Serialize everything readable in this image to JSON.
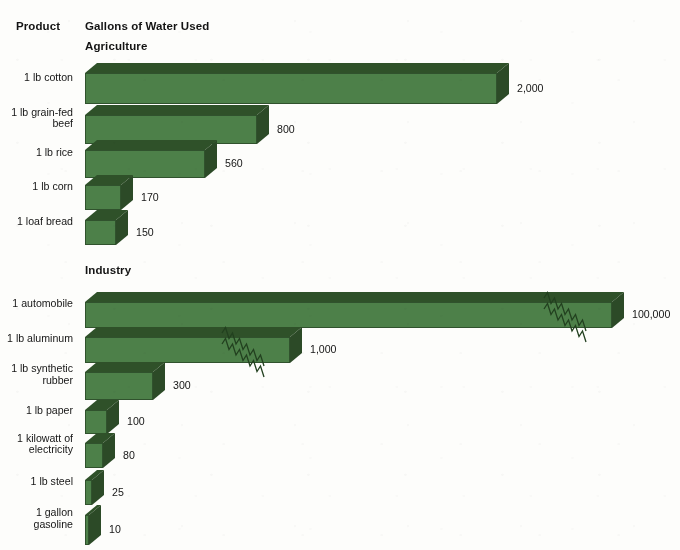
{
  "headers": {
    "product": "Product",
    "gallons": "Gallons of Water Used"
  },
  "sections": [
    {
      "key": "agriculture",
      "title": "Agriculture"
    },
    {
      "key": "industry",
      "title": "Industry"
    }
  ],
  "colors": {
    "bar_front": "#4d8049",
    "bar_top": "#2f5129",
    "bar_end": "#2c4a27",
    "background": "#fdfdfb",
    "text": "#141414"
  },
  "chart_data": {
    "type": "bar",
    "orientation": "horizontal",
    "style": "3d-isometric",
    "title": "Gallons of Water Used",
    "xlabel": "Gallons of Water Used",
    "ylabel": "Product",
    "grid": false,
    "legend": false,
    "axis_break_note": "Bars for '1 automobile' and '1 lb aluminum' are drawn with zigzag break symbols indicating a truncated (non-linear) length scale.",
    "groups": [
      {
        "name": "Agriculture",
        "categories": [
          "1 lb cotton",
          "1 lb grain-fed beef",
          "1 lb rice",
          "1 lb corn",
          "1 loaf bread"
        ],
        "values": [
          2000,
          800,
          560,
          170,
          150
        ],
        "value_labels": [
          "2,000",
          "800",
          "560",
          "170",
          "150"
        ]
      },
      {
        "name": "Industry",
        "categories": [
          "1 automobile",
          "1 lb aluminum",
          "1 lb synthetic rubber",
          "1 lb paper",
          "1 kilowatt of electricity",
          "1 lb steel",
          "1 gallon gasoline"
        ],
        "values": [
          100000,
          1000,
          300,
          100,
          80,
          25,
          10
        ],
        "value_labels": [
          "100,000",
          "1,000",
          "300",
          "100",
          "80",
          "25",
          "10"
        ]
      }
    ]
  },
  "rows": [
    {
      "id": "cotton",
      "label": "1 lb cotton",
      "value_label": "2,000",
      "section": "agriculture"
    },
    {
      "id": "beef",
      "label": "1 lb grain-fed\nbeef",
      "value_label": "800",
      "section": "agriculture"
    },
    {
      "id": "rice",
      "label": "1 lb rice",
      "value_label": "560",
      "section": "agriculture"
    },
    {
      "id": "corn",
      "label": "1 lb corn",
      "value_label": "170",
      "section": "agriculture"
    },
    {
      "id": "bread",
      "label": "1 loaf bread",
      "value_label": "150",
      "section": "agriculture"
    },
    {
      "id": "automobile",
      "label": "1 automobile",
      "value_label": "100,000",
      "section": "industry"
    },
    {
      "id": "aluminum",
      "label": "1 lb aluminum",
      "value_label": "1,000",
      "section": "industry"
    },
    {
      "id": "rubber",
      "label": "1 lb synthetic\nrubber",
      "value_label": "300",
      "section": "industry"
    },
    {
      "id": "paper",
      "label": "1 lb paper",
      "value_label": "100",
      "section": "industry"
    },
    {
      "id": "electricity",
      "label": "1 kilowatt of\nelectricity",
      "value_label": "80",
      "section": "industry"
    },
    {
      "id": "steel",
      "label": "1 lb steel",
      "value_label": "25",
      "section": "industry"
    },
    {
      "id": "gasoline",
      "label": "1 gallon\ngasoline",
      "value_label": "10",
      "section": "industry"
    }
  ],
  "geometry": {
    "bar_left": 85,
    "depth_x": 12,
    "depth_y": 10,
    "rows": [
      {
        "id": "cotton",
        "top": 63,
        "h": 31,
        "w": 412
      },
      {
        "id": "beef",
        "top": 105,
        "h": 29,
        "w": 172
      },
      {
        "id": "rice",
        "top": 140,
        "h": 28,
        "w": 120
      },
      {
        "id": "corn",
        "top": 175,
        "h": 25,
        "w": 36
      },
      {
        "id": "bread",
        "top": 210,
        "h": 25,
        "w": 31
      },
      {
        "id": "automobile",
        "top": 292,
        "h": 26,
        "w": 527
      },
      {
        "id": "aluminum",
        "top": 327,
        "h": 26,
        "w": 205
      },
      {
        "id": "rubber",
        "top": 362,
        "h": 28,
        "w": 68
      },
      {
        "id": "paper",
        "top": 400,
        "h": 24,
        "w": 22
      },
      {
        "id": "electricity",
        "top": 433,
        "h": 25,
        "w": 18
      },
      {
        "id": "steel",
        "top": 470,
        "h": 25,
        "w": 7
      },
      {
        "id": "gasoline",
        "top": 505,
        "h": 30,
        "w": 4
      }
    ]
  }
}
